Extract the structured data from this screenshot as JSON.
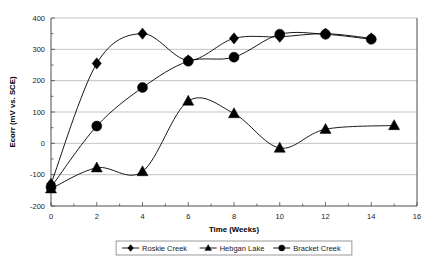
{
  "chart_data": {
    "type": "line",
    "title": "",
    "xlabel": "Time (Weeks)",
    "ylabel": "Ecorr (mV vs. SCE)",
    "xlim": [
      0,
      16
    ],
    "ylim": [
      -200,
      400
    ],
    "xticks": [
      0,
      2,
      4,
      6,
      8,
      10,
      12,
      14,
      16
    ],
    "xtick_labels": [
      "0",
      "2",
      "4",
      "6",
      "8",
      "10",
      "12",
      "14",
      "16"
    ],
    "xminor_step": 1,
    "yticks": [
      -200,
      -100,
      0,
      100,
      200,
      300,
      400
    ],
    "ytick_labels": [
      "-200",
      "-100",
      "0",
      "100",
      "200",
      "300",
      "400"
    ],
    "grid": "horizontal",
    "legend_position": "bottom",
    "marker_color": "#000000",
    "line_color": "#000000",
    "series": [
      {
        "name": "Roskie Creek",
        "marker": "diamond",
        "x": [
          0,
          2,
          4,
          6,
          8,
          10,
          12,
          14
        ],
        "values": [
          -130,
          255,
          350,
          265,
          335,
          340,
          350,
          335
        ]
      },
      {
        "name": "Hebgan Lake",
        "marker": "triangle",
        "x": [
          0,
          2,
          4,
          6,
          8,
          10,
          12,
          15
        ],
        "values": [
          -145,
          -78,
          -90,
          135,
          95,
          -15,
          45,
          57
        ]
      },
      {
        "name": "Bracket Creek",
        "marker": "circle",
        "x": [
          0,
          2,
          4,
          6,
          8,
          10,
          12,
          14
        ],
        "values": [
          -140,
          55,
          178,
          262,
          275,
          348,
          348,
          332
        ]
      }
    ]
  }
}
